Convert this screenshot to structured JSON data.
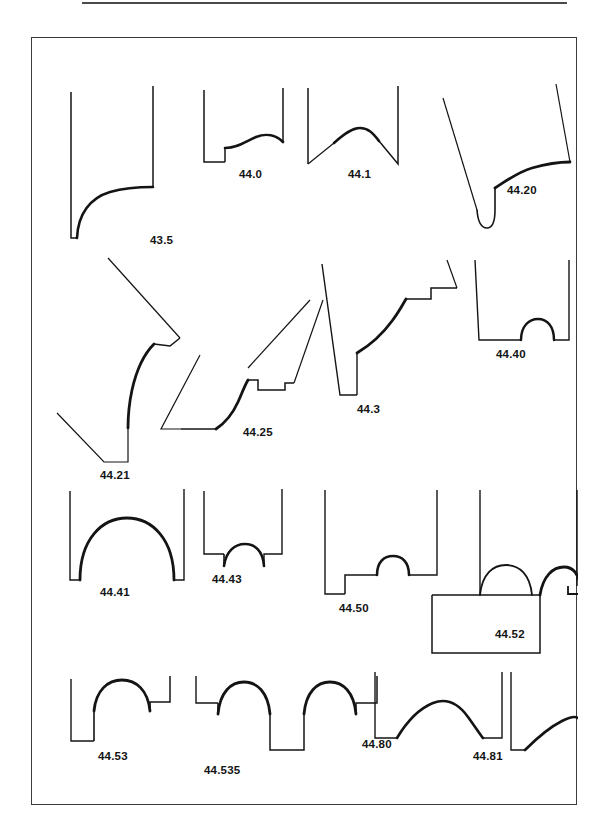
{
  "page": {
    "background_color": "#ffffff",
    "ink_color": "#141414",
    "frame_color": "#3b3b3b",
    "width": 612,
    "height": 838
  },
  "top_rule": {
    "name": "header-rule",
    "color": "#4a4a4a"
  },
  "plate": {
    "title": "",
    "description": "Plate of drawn moulding / vessel profile sections arranged in four rows, each section annotated with a numeric type code.",
    "rows": [
      {
        "row_index": 1,
        "profiles": [
          {
            "code": "43.5",
            "label_x": 118,
            "label_y": 206
          },
          {
            "code": "44.0",
            "label_x": 219,
            "label_y": 136
          },
          {
            "code": "44.1",
            "label_x": 330,
            "label_y": 136
          },
          {
            "code": "44.20",
            "label_x": 489,
            "label_y": 165
          }
        ]
      },
      {
        "row_index": 2,
        "profiles": [
          {
            "code": "44.21",
            "label_x": 84,
            "label_y": 370
          },
          {
            "code": "44.25",
            "label_x": 232,
            "label_y": 368
          },
          {
            "code": "44.3",
            "label_x": 339,
            "label_y": 346
          },
          {
            "code": "44.40",
            "label_x": 477,
            "label_y": 330
          }
        ]
      },
      {
        "row_index": 3,
        "profiles": [
          {
            "code": "44.41",
            "label_x": 91,
            "label_y": 505
          },
          {
            "code": "44.43",
            "label_x": 196,
            "label_y": 507
          },
          {
            "code": "44.50",
            "label_x": 319,
            "label_y": 526
          },
          {
            "code": "44.52",
            "label_x": 474,
            "label_y": 548
          }
        ]
      },
      {
        "row_index": 4,
        "profiles": [
          {
            "code": "44.53",
            "label_x": 88,
            "label_y": 705
          },
          {
            "code": "44.535",
            "label_x": 196,
            "label_y": 717
          },
          {
            "code": "44.80",
            "label_x": 353,
            "label_y": 692
          },
          {
            "code": "44.81",
            "label_x": 472,
            "label_y": 705
          }
        ]
      }
    ],
    "profile_count": 16,
    "codes": [
      "43.5",
      "44.0",
      "44.1",
      "44.20",
      "44.21",
      "44.25",
      "44.3",
      "44.40",
      "44.41",
      "44.43",
      "44.50",
      "44.52",
      "44.53",
      "44.535",
      "44.80",
      "44.81"
    ]
  }
}
